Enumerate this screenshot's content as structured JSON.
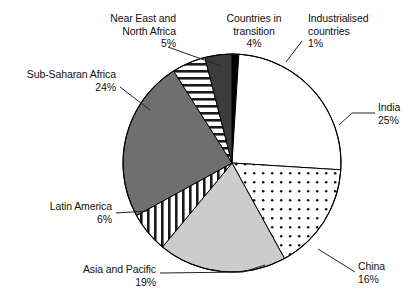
{
  "chart_data": {
    "type": "pie",
    "title": "",
    "categories": [
      "Industrialised countries",
      "India",
      "China",
      "Asia and Pacific",
      "Latin America",
      "Sub-Saharan Africa",
      "Near East and North Africa",
      "Countries in transition"
    ],
    "values": [
      1,
      25,
      16,
      19,
      6,
      24,
      5,
      4
    ],
    "value_labels": [
      "1%",
      "25%",
      "16%",
      "19%",
      "6%",
      "24%",
      "5%",
      "4%"
    ],
    "unit": "%",
    "start_angle_deg": 0,
    "direction": "clockwise",
    "legend": "none",
    "grid": false,
    "slices": [
      {
        "name": "Industrialised countries",
        "value": 1,
        "label": "1%",
        "fill": "black",
        "color": "#000000"
      },
      {
        "name": "India",
        "value": 25,
        "label": "25%",
        "fill": "white",
        "color": "#ffffff"
      },
      {
        "name": "China",
        "value": 16,
        "label": "16%",
        "fill": "dots",
        "color": "#ffffff"
      },
      {
        "name": "Asia and Pacific",
        "value": 19,
        "label": "19%",
        "fill": "light-gray",
        "color": "#c9c9c9"
      },
      {
        "name": "Latin America",
        "value": 6,
        "label": "6%",
        "fill": "vertical-stripes",
        "color": "#ffffff"
      },
      {
        "name": "Sub-Saharan Africa",
        "value": 24,
        "label": "24%",
        "fill": "mid-gray",
        "color": "#6e6e6e"
      },
      {
        "name": "Near East and North Africa",
        "value": 5,
        "label": "5%",
        "fill": "horizontal-stripes",
        "color": "#ffffff"
      },
      {
        "name": "Countries in transition",
        "value": 4,
        "label": "4%",
        "fill": "dark-gray",
        "color": "#3a3a3a"
      }
    ]
  },
  "labels": {
    "near_east": {
      "line1": "Near East and",
      "line2": "North Africa",
      "value": "5%"
    },
    "countries_transition": {
      "line1": "Countries in",
      "line2": "transition",
      "value": "4%"
    },
    "industrialised": {
      "line1": "Industrialised",
      "line2": "countries",
      "value": "1%"
    },
    "sub_saharan": {
      "line1": "Sub-Saharan Africa",
      "value": "24%"
    },
    "india": {
      "line1": "India",
      "value": "25%"
    },
    "china": {
      "line1": "China",
      "value": "16%"
    },
    "asia_pacific": {
      "line1": "Asia and Pacific",
      "value": "19%"
    },
    "latin_america": {
      "line1": "Latin America",
      "value": "6%"
    }
  },
  "style": {
    "stroke": "#000000",
    "background": "#ffffff"
  }
}
